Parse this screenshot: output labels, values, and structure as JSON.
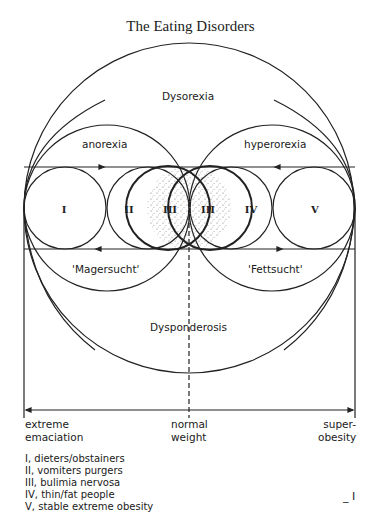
{
  "title": "The Eating Disorders",
  "regions": {
    "outer": "Dysorexia",
    "upper_left": "anorexia",
    "upper_right": "hyperorexia",
    "lower_left": "'Magersucht'",
    "lower_right": "'Fettsucht'",
    "bottom": "Dysponderosis"
  },
  "circles": [
    {
      "id": "I",
      "label": "I"
    },
    {
      "id": "II",
      "label": "II"
    },
    {
      "id": "III-left",
      "label": "III"
    },
    {
      "id": "III-right",
      "label": "III"
    },
    {
      "id": "IV",
      "label": "IV"
    },
    {
      "id": "V",
      "label": "V"
    }
  ],
  "scale": {
    "left": [
      "extreme",
      "emaciation"
    ],
    "center": [
      "normal",
      "weight"
    ],
    "right": [
      "super-",
      "obesity"
    ]
  },
  "legend": [
    "I, dieters/obstainers",
    "II, vomiters purgers",
    "III, bulimia nervosa",
    "IV, thin/fat people",
    "V, stable extreme obesity"
  ],
  "page_mark": "_ I"
}
